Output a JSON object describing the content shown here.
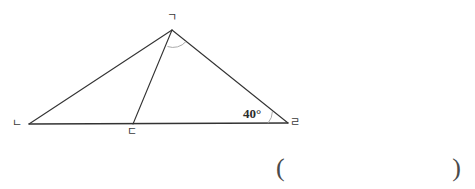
{
  "figure": {
    "name": "triangle-with-cevian-diagram",
    "background_color": "#ffffff",
    "stroke_color": "#333333",
    "arc_color": "#9a9a9a",
    "vertices": {
      "top": {
        "label": "ㄱ",
        "x": 172,
        "y": 30
      },
      "left": {
        "label": "ㄴ",
        "x": 29,
        "y": 124
      },
      "middle": {
        "label": "ㄷ",
        "x": 133,
        "y": 124
      },
      "right": {
        "label": "ㄹ",
        "x": 288,
        "y": 123
      }
    },
    "segments": [
      {
        "name": "base-nieun-to-rieul",
        "from": "left",
        "to": "right"
      },
      {
        "name": "side-nieun-to-giyeok",
        "from": "left",
        "to": "top"
      },
      {
        "name": "side-giyeok-to-rieul",
        "from": "top",
        "to": "right"
      },
      {
        "name": "cevian-giyeok-to-digeut",
        "from": "top",
        "to": "middle"
      }
    ],
    "angles": [
      {
        "name": "angle-at-rieul",
        "vertex": "right",
        "value": "40",
        "unit": "°",
        "label": "40°",
        "has_arc": true
      },
      {
        "name": "angle-at-giyeok",
        "vertex": "top",
        "label": "",
        "has_arc": true
      }
    ]
  },
  "answer_blank": {
    "open_paren": "(",
    "close_paren": ")",
    "value": ""
  }
}
